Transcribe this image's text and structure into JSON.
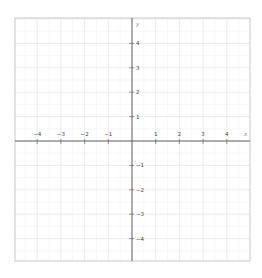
{
  "plane": {
    "frame": {
      "left": 15,
      "top": 18,
      "right": 250,
      "bottom": 261
    },
    "origin": {
      "x": 132,
      "y": 141
    },
    "unit_px": {
      "x": 23.7,
      "y": 24.4
    },
    "minor_divisions": 2,
    "colors": {
      "border": "#c8c8c8",
      "major_grid": "#e6e6e6",
      "minor_grid": "#f3f3f3",
      "axis": "#555555",
      "tick": "#555555",
      "label": "#444444"
    },
    "x_axis": {
      "name": "x",
      "ticks": [
        -4,
        -3,
        -2,
        -1,
        1,
        2,
        3,
        4
      ],
      "tick_labels": [
        "−4",
        "−3",
        "−2",
        "−1",
        "1",
        "2",
        "3",
        "4"
      ]
    },
    "y_axis": {
      "name": "y",
      "ticks": [
        4,
        3,
        2,
        1,
        -1,
        -2,
        -3,
        -4
      ],
      "tick_labels": [
        "4",
        "3",
        "2",
        "1",
        "−1",
        "−2",
        "−3",
        "−4"
      ]
    }
  }
}
